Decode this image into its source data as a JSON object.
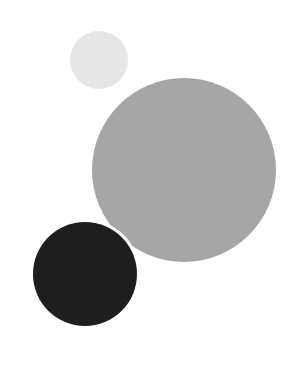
{
  "canvas": {
    "width": 302,
    "height": 380,
    "background": "#ffffff"
  },
  "shapes": [
    {
      "name": "small-light-circle",
      "cx": 99,
      "cy": 60,
      "r": 29,
      "color": "#e6e6e6",
      "outline": null
    },
    {
      "name": "large-gray-circle",
      "cx": 184,
      "cy": 170,
      "r": 92,
      "color": "#a6a6a6",
      "outline": null
    },
    {
      "name": "dark-circle",
      "cx": 85,
      "cy": 274,
      "r": 52,
      "color": "#1e1e1e",
      "outline": "#ffffff"
    }
  ]
}
